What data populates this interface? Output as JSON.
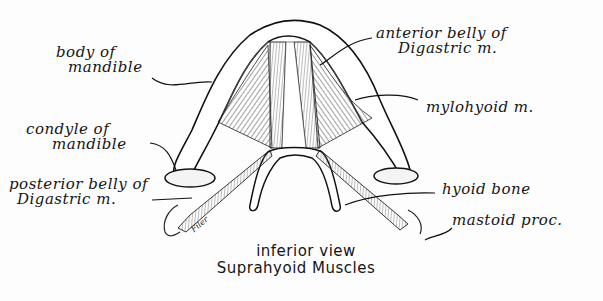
{
  "diagram": {
    "title": "Suprahyoid Muscles",
    "subtitle": "inferior view",
    "artist_signature": "Filer",
    "labels": [
      {
        "id": "body-of-mandible",
        "line1": "body of",
        "line2": "mandible"
      },
      {
        "id": "condyle-of-mandible",
        "line1": "condyle of",
        "line2": "mandible"
      },
      {
        "id": "posterior-belly-digastric",
        "line1": "posterior belly of",
        "line2": "Digastric m."
      },
      {
        "id": "anterior-belly-digastric",
        "line1": "anterior belly of",
        "line2": "Digastric m."
      },
      {
        "id": "mylohyoid",
        "line1": "mylohyoid m."
      },
      {
        "id": "hyoid-bone",
        "line1": "hyoid bone"
      },
      {
        "id": "mastoid-process",
        "line1": "mastoid proc."
      }
    ]
  }
}
